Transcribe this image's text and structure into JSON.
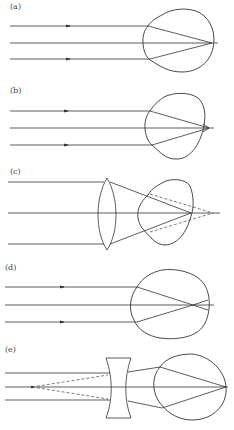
{
  "panels": [
    {
      "id": "a",
      "label": "(a)",
      "description": "Normal eye: parallel rays focus on retina"
    },
    {
      "id": "b",
      "label": "(b)",
      "description": "Hyperopic eye: rays focus behind retina"
    },
    {
      "id": "c",
      "label": "(c)",
      "description": "Hyperopia corrected with converging lens"
    },
    {
      "id": "d",
      "label": "(d)",
      "description": "Myopic eye: rays focus in front of retina"
    },
    {
      "id": "e",
      "label": "(e)",
      "description": "Myopia corrected with diverging lens"
    }
  ],
  "colors": {
    "line": "#333333",
    "background": "#ffffff"
  }
}
